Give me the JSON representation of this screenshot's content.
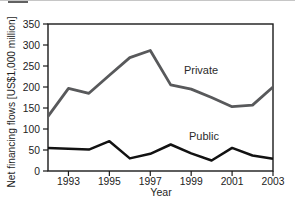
{
  "chart_data": {
    "type": "line",
    "title": "",
    "xlabel": "Year",
    "ylabel": "Net financing flows [US$1,000 million]",
    "x": [
      1992,
      1993,
      1994,
      1995,
      1996,
      1997,
      1998,
      1999,
      2000,
      2001,
      2002,
      2003
    ],
    "series": [
      {
        "name": "Private",
        "label": "Private",
        "color": "#58595b",
        "stroke_width": 2.8,
        "values": [
          130,
          197,
          185,
          228,
          270,
          287,
          205,
          195,
          175,
          153,
          157,
          200
        ]
      },
      {
        "name": "Public",
        "label": "Public",
        "color": "#121212",
        "stroke_width": 2.5,
        "values": [
          55,
          53,
          51,
          71,
          30,
          41,
          63,
          42,
          25,
          55,
          37,
          29
        ]
      }
    ],
    "xlim": [
      1992,
      2003
    ],
    "ylim": [
      0,
      350
    ],
    "xticks": [
      1993,
      1995,
      1997,
      1999,
      2001,
      2003
    ],
    "yticks": [
      0,
      50,
      100,
      150,
      200,
      250,
      300,
      350
    ],
    "grid": false,
    "legend": "inline-labels",
    "plot_border": "box",
    "axis_color": "#1a1a1a",
    "tick_label_color": "#222222",
    "background": "#ffffff"
  }
}
